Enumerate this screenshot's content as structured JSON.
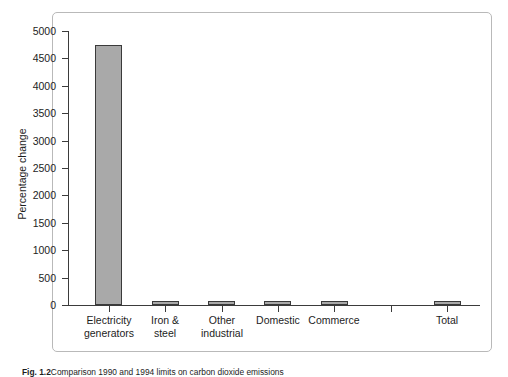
{
  "figure": {
    "caption_label": "Fig. 1.2",
    "caption_text": "Comparison 1990 and 1994 limits on carbon dioxide emissions"
  },
  "chart_data": {
    "type": "bar",
    "title": "",
    "xlabel": "",
    "ylabel": "Percentage change",
    "ylim": [
      0,
      5000
    ],
    "ytick_labels": [
      "0",
      "500",
      "1000",
      "1500",
      "2000",
      "2500",
      "3000",
      "3500",
      "4000",
      "4500",
      "5000"
    ],
    "ytick_values": [
      0,
      500,
      1000,
      1500,
      2000,
      2500,
      3000,
      3500,
      4000,
      4500,
      5000
    ],
    "grid": false,
    "legend": "none",
    "categories": [
      "Electricity\ngenerators",
      "Iron &\nsteel",
      "Other\nindustrial",
      "Domestic",
      "Commerce",
      "",
      "Total"
    ],
    "values": [
      4750,
      80,
      55,
      70,
      65,
      0,
      70
    ],
    "bar_color": "#a9a9a9",
    "bar_edge_color": "#3a3a3a",
    "axis_color": "#3b3b3b",
    "frame_color": "#b9b9b9"
  }
}
